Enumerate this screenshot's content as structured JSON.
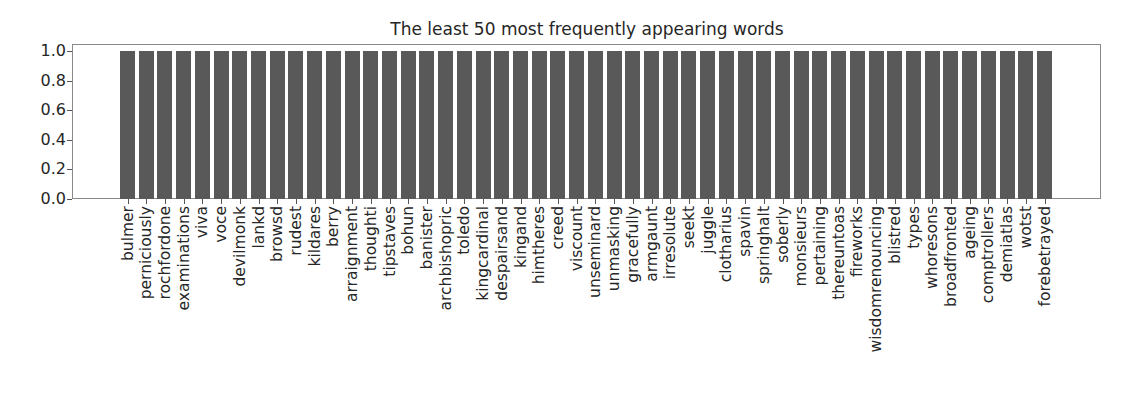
{
  "chart_data": {
    "type": "bar",
    "title": "The least 50 most frequently appearing words",
    "xlabel": "",
    "ylabel": "",
    "ylim": [
      0,
      1.0
    ],
    "yticks": [
      "0.0",
      "0.2",
      "0.4",
      "0.6",
      "0.8",
      "1.0"
    ],
    "grid": false,
    "bar_color": "#595959",
    "categories": [
      "bulmer",
      "perniciously",
      "rochfordone",
      "examinations",
      "viva",
      "voce",
      "devilmonk",
      "lankd",
      "browsd",
      "rudest",
      "kildares",
      "berry",
      "arraignment",
      "thoughti",
      "tipstaves",
      "bohun",
      "banister",
      "archbishopric",
      "toledo",
      "kingcardinal",
      "despairsand",
      "kingand",
      "himtheres",
      "creed",
      "viscount",
      "unseminard",
      "unmasking",
      "gracefully",
      "armgaunt",
      "irresolute",
      "seekt",
      "juggle",
      "clotharius",
      "spavin",
      "springhalt",
      "soberly",
      "monsieurs",
      "pertaining",
      "thereuntoas",
      "fireworks",
      "wisdomrenouncing",
      "blistred",
      "types",
      "whoresons",
      "broadfronted",
      "ageing",
      "comptrollers",
      "demiatlas",
      "wotst",
      "forebetrayed"
    ],
    "values": [
      1,
      1,
      1,
      1,
      1,
      1,
      1,
      1,
      1,
      1,
      1,
      1,
      1,
      1,
      1,
      1,
      1,
      1,
      1,
      1,
      1,
      1,
      1,
      1,
      1,
      1,
      1,
      1,
      1,
      1,
      1,
      1,
      1,
      1,
      1,
      1,
      1,
      1,
      1,
      1,
      1,
      1,
      1,
      1,
      1,
      1,
      1,
      1,
      1,
      1
    ]
  }
}
